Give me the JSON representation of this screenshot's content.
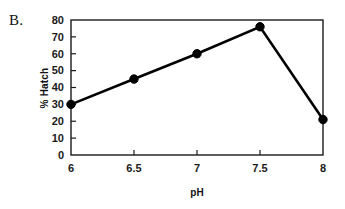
{
  "figure": {
    "panel_label": "B."
  },
  "chart_data": {
    "type": "line",
    "title": "",
    "subtitle": "",
    "xlabel": "pH",
    "ylabel": "% Hatch",
    "x": [
      6,
      6.5,
      7,
      7.5,
      8
    ],
    "values": [
      30,
      45,
      60,
      76,
      21
    ],
    "categories": [
      "6",
      "6.5",
      "7",
      "7.5",
      "8"
    ],
    "series": [
      {
        "name": "% Hatch",
        "values": [
          30,
          45,
          60,
          76,
          21
        ]
      }
    ],
    "xlim": [
      6,
      8
    ],
    "ylim": [
      0,
      80
    ],
    "x_ticks": [
      6,
      6.5,
      7,
      7.5,
      8
    ],
    "x_tick_labels": [
      "6",
      "6.5",
      "7",
      "7.5",
      "8"
    ],
    "y_ticks": [
      0,
      10,
      20,
      30,
      40,
      50,
      60,
      70,
      80
    ],
    "y_tick_labels": [
      "0",
      "10",
      "20",
      "30",
      "40",
      "50",
      "60",
      "70",
      "80"
    ],
    "grid": false,
    "legend": false,
    "legend_position": "none",
    "marker": "filled-circle",
    "line_color": "#000000",
    "marker_color": "#000000",
    "axis_color": "#1a1a1a",
    "background_color": "#ffffff",
    "annotations": []
  }
}
